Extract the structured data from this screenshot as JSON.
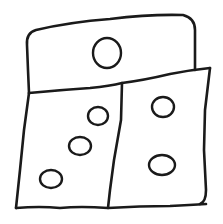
{
  "image": {
    "description": "Hand-drawn sketch of three adjoining quadrilateral panels with circular dots",
    "stroke_color": "#1a1a1a",
    "background_color": "#ffffff",
    "panels": [
      {
        "name": "top-panel",
        "dots": 1
      },
      {
        "name": "bottom-left-panel",
        "dots": 3
      },
      {
        "name": "bottom-right-panel",
        "dots": 2
      }
    ],
    "total_dots": 6
  }
}
